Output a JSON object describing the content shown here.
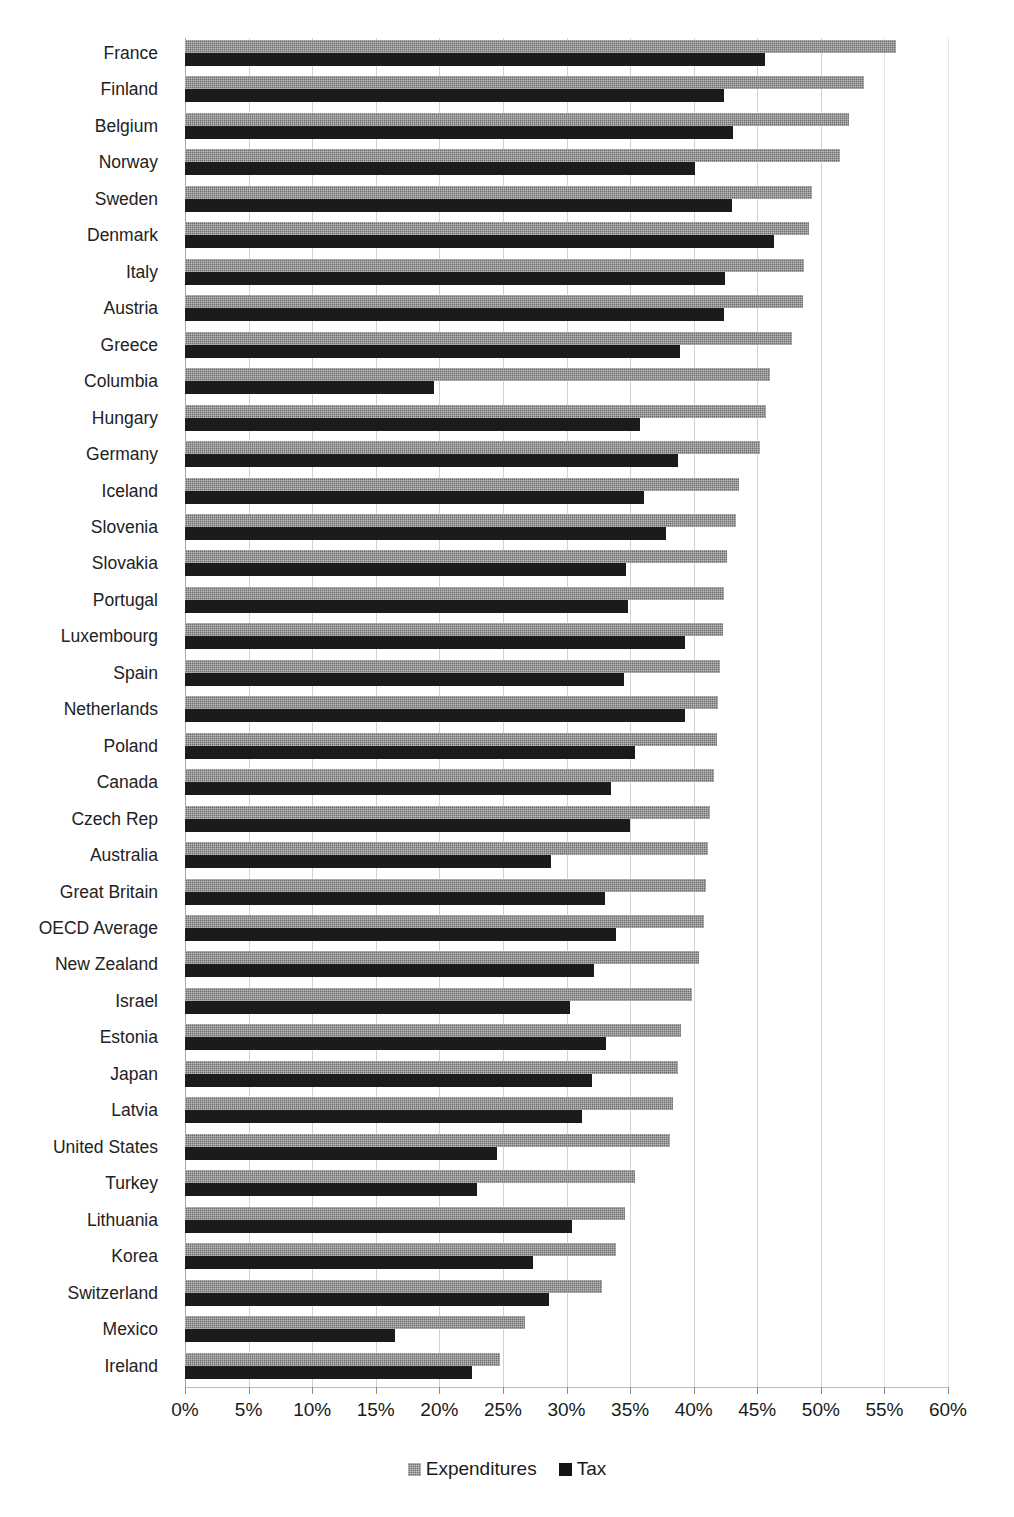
{
  "chart_data": {
    "type": "bar",
    "orientation": "horizontal",
    "title": "",
    "subtitle": "",
    "xlabel": "",
    "ylabel": "",
    "xlim": [
      0,
      60
    ],
    "xtick_step": 5,
    "xtick_labels": [
      "0%",
      "5%",
      "10%",
      "15%",
      "20%",
      "25%",
      "30%",
      "35%",
      "40%",
      "45%",
      "50%",
      "55%",
      "60%"
    ],
    "xtick_values": [
      0,
      5,
      10,
      15,
      20,
      25,
      30,
      35,
      40,
      45,
      50,
      55,
      60
    ],
    "value_unit": "%",
    "grid": true,
    "grid_axis": "x",
    "legend_position": "bottom",
    "legend": [
      "Expenditures",
      "Tax"
    ],
    "categories": [
      "France",
      "Finland",
      "Belgium",
      "Norway",
      "Sweden",
      "Denmark",
      "Italy",
      "Austria",
      "Greece",
      "Columbia",
      "Hungary",
      "Germany",
      "Iceland",
      "Slovenia",
      "Slovakia",
      "Portugal",
      "Luxembourg",
      "Spain",
      "Netherlands",
      "Poland",
      "Canada",
      "Czech Rep",
      "Australia",
      "Great Britain",
      "OECD Average",
      "New Zealand",
      "Israel",
      "Estonia",
      "Japan",
      "Latvia",
      "United States",
      "Turkey",
      "Lithuania",
      "Korea",
      "Switzerland",
      "Mexico",
      "Ireland"
    ],
    "series": [
      {
        "name": "Expenditures",
        "color": "#6e6e6e",
        "values": [
          55.9,
          53.4,
          52.2,
          51.5,
          49.3,
          49.1,
          48.7,
          48.6,
          47.7,
          46.0,
          45.7,
          45.2,
          43.6,
          43.3,
          42.6,
          42.4,
          42.3,
          42.1,
          41.9,
          41.8,
          41.6,
          41.3,
          41.1,
          41.0,
          40.8,
          40.4,
          39.9,
          39.0,
          38.8,
          38.4,
          38.1,
          35.4,
          34.6,
          33.9,
          32.8,
          26.7,
          24.8
        ]
      },
      {
        "name": "Tax",
        "color": "#1b1b1b",
        "values": [
          45.6,
          42.4,
          43.1,
          40.1,
          43.0,
          46.3,
          42.5,
          42.4,
          38.9,
          19.6,
          35.8,
          38.8,
          36.1,
          37.8,
          34.7,
          34.8,
          39.3,
          34.5,
          39.3,
          35.4,
          33.5,
          35.0,
          28.8,
          33.0,
          33.9,
          32.2,
          30.3,
          33.1,
          32.0,
          31.2,
          24.5,
          23.0,
          30.4,
          27.4,
          28.6,
          16.5,
          22.6
        ]
      }
    ]
  },
  "legend": {
    "items": [
      {
        "label": "Expenditures",
        "swatch": "expenditures-swatch"
      },
      {
        "label": "Tax",
        "swatch": "tax-swatch"
      }
    ]
  }
}
